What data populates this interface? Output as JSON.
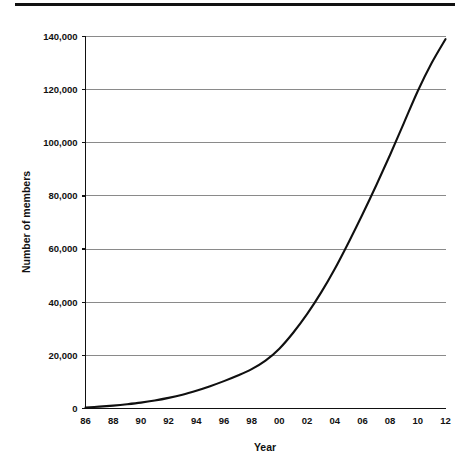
{
  "figure": {
    "top_rule": "horizontal-rule",
    "background_color": "#ffffff"
  },
  "chart_data": {
    "type": "line",
    "title": "",
    "subtitle": "",
    "xlabel": "Year",
    "ylabel": "Number of members",
    "xlim": [
      1986,
      2012
    ],
    "ylim": [
      0,
      140000
    ],
    "grid": true,
    "legend": null,
    "line_color": "#101010",
    "grid_color": "#8a8a8a",
    "x_tick_labels": [
      "86",
      "88",
      "90",
      "92",
      "94",
      "96",
      "98",
      "00",
      "02",
      "04",
      "06",
      "08",
      "10",
      "12"
    ],
    "x_tick_values": [
      1986,
      1988,
      1990,
      1992,
      1994,
      1996,
      1998,
      2000,
      2002,
      2004,
      2006,
      2008,
      2010,
      2012
    ],
    "y_tick_labels": [
      "0",
      "20,000",
      "40,000",
      "60,000",
      "80,000",
      "100,000",
      "120,000",
      "140,000"
    ],
    "y_tick_values": [
      0,
      20000,
      40000,
      60000,
      80000,
      100000,
      120000,
      140000
    ],
    "series": [
      {
        "name": "Number of members",
        "x": [
          1986,
          1987,
          1988,
          1989,
          1990,
          1991,
          1992,
          1993,
          1994,
          1995,
          1996,
          1997,
          1998,
          1999,
          2000,
          2001,
          2002,
          2003,
          2004,
          2005,
          2006,
          2007,
          2008,
          2009,
          2010,
          2011,
          2012
        ],
        "values": [
          400,
          700,
          1100,
          1600,
          2200,
          3000,
          4000,
          5200,
          6700,
          8400,
          10300,
          12400,
          14800,
          18000,
          22500,
          28500,
          35500,
          43500,
          52500,
          62500,
          73000,
          84000,
          95500,
          107500,
          119500,
          130000,
          139000
        ]
      }
    ]
  }
}
